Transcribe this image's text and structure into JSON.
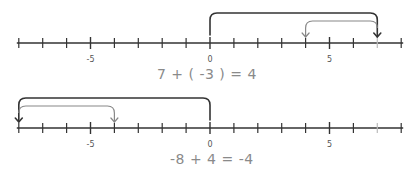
{
  "diagrams": [
    {
      "equation": "7 + ( -3 ) = 4",
      "axis": {
        "min": -8,
        "max": 8,
        "labels": [
          {
            "value": -5,
            "text": "-5"
          },
          {
            "value": 0,
            "text": "0"
          },
          {
            "value": 5,
            "text": "5"
          }
        ]
      },
      "jumps": [
        {
          "from": 0,
          "to": 7,
          "style": "dark",
          "meaning": "+7"
        },
        {
          "from": 7,
          "to": 4,
          "style": "light",
          "meaning": "-3"
        }
      ],
      "highlighted_tick": 7
    },
    {
      "equation": "-8 + 4 = -4",
      "axis": {
        "min": -8,
        "max": 8,
        "labels": [
          {
            "value": -5,
            "text": "-5"
          },
          {
            "value": 0,
            "text": "0"
          },
          {
            "value": 5,
            "text": "5"
          }
        ]
      },
      "jumps": [
        {
          "from": 0,
          "to": -8,
          "style": "dark",
          "meaning": "-8"
        },
        {
          "from": -8,
          "to": -4,
          "style": "light",
          "meaning": "+4"
        }
      ],
      "highlighted_tick": 7
    }
  ],
  "colors": {
    "axis": "#333333",
    "dark_arc": "#333333",
    "light_arc": "#888888",
    "faded_tick": "#bbbbbb",
    "equation_text": "#8a8a8a"
  }
}
